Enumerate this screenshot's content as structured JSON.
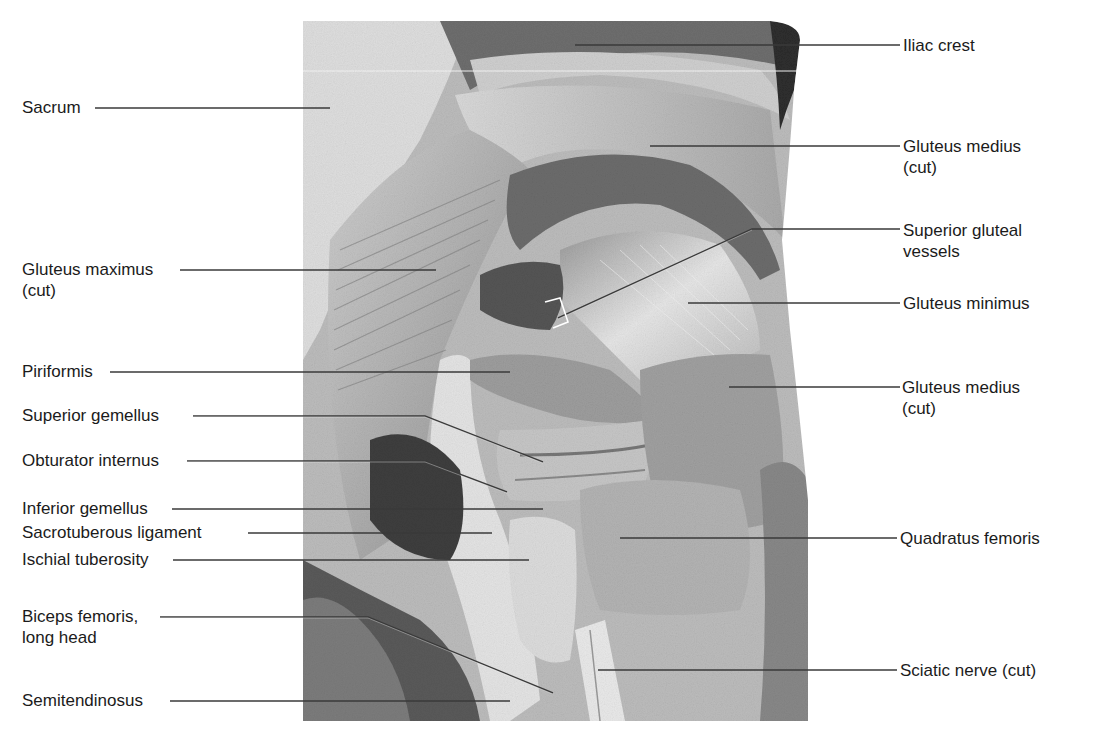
{
  "figure": {
    "labels_left": [
      {
        "id": "sacrum",
        "lines": [
          "Sacrum"
        ],
        "x": 22,
        "y": 97
      },
      {
        "id": "gluteus-maximus",
        "lines": [
          "Gluteus maximus",
          "(cut)"
        ],
        "x": 22,
        "y": 259
      },
      {
        "id": "piriformis",
        "lines": [
          "Piriformis"
        ],
        "x": 22,
        "y": 361
      },
      {
        "id": "superior-gemellus",
        "lines": [
          "Superior gemellus"
        ],
        "x": 22,
        "y": 405
      },
      {
        "id": "obturator-internus",
        "lines": [
          "Obturator internus"
        ],
        "x": 22,
        "y": 450
      },
      {
        "id": "inferior-gemellus",
        "lines": [
          "Inferior gemellus"
        ],
        "x": 22,
        "y": 498
      },
      {
        "id": "sacrotuberous-ligament",
        "lines": [
          "Sacrotuberous ligament"
        ],
        "x": 22,
        "y": 522
      },
      {
        "id": "ischial-tuberosity",
        "lines": [
          "Ischial tuberosity"
        ],
        "x": 22,
        "y": 549
      },
      {
        "id": "biceps-femoris",
        "lines": [
          "Biceps femoris,",
          "long head"
        ],
        "x": 22,
        "y": 606
      },
      {
        "id": "semitendinosus",
        "lines": [
          "Semitendinosus"
        ],
        "x": 22,
        "y": 690
      }
    ],
    "labels_right": [
      {
        "id": "iliac-crest",
        "lines": [
          "Iliac crest"
        ],
        "x": 903,
        "y": 35
      },
      {
        "id": "gluteus-medius-upper",
        "lines": [
          "Gluteus medius",
          "(cut)"
        ],
        "x": 903,
        "y": 136
      },
      {
        "id": "superior-gluteal-vessels",
        "lines": [
          "Superior gluteal",
          "vessels"
        ],
        "x": 903,
        "y": 220
      },
      {
        "id": "gluteus-minimus",
        "lines": [
          "Gluteus minimus"
        ],
        "x": 903,
        "y": 295
      },
      {
        "id": "gluteus-medius-lower",
        "lines": [
          "Gluteus medius",
          "(cut)"
        ],
        "x": 902,
        "y": 377
      },
      {
        "id": "quadratus-femoris",
        "lines": [
          "Quadratus femoris"
        ],
        "x": 900,
        "y": 529
      },
      {
        "id": "sciatic-nerve",
        "lines": [
          "Sciatic nerve (cut)"
        ],
        "x": 900,
        "y": 640
      }
    ]
  }
}
